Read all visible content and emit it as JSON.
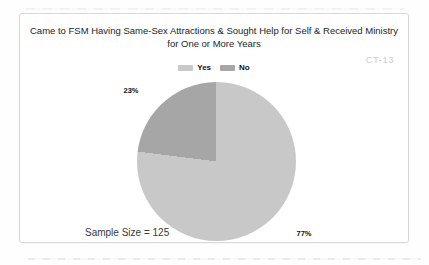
{
  "chart_data": {
    "type": "pie",
    "title": "Came to FSM Having Same-Sex Attractions & Sought Help for Self & Received Ministry for One or More Years",
    "title_lines": [
      "Came to FSM Having Same-Sex Attractions & Sought Help for Self & Received Ministry",
      "for One or More Years"
    ],
    "categories": [
      "Yes",
      "No"
    ],
    "values": [
      77,
      23
    ],
    "series": [
      {
        "label": "Yes",
        "value": 77,
        "display": "77%",
        "color": "#c8c8c8"
      },
      {
        "label": "No",
        "value": 23,
        "display": "23%",
        "color": "#a6a6a6"
      }
    ],
    "legend_position": "top",
    "annotations": {
      "sample_size": "Sample Size = 125",
      "code": "CT-13"
    }
  }
}
